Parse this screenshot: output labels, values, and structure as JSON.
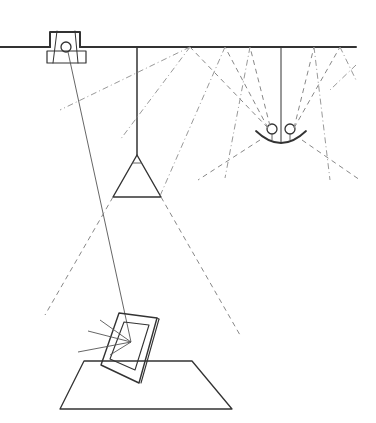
{
  "diagram": {
    "title": "",
    "type": "lighting-setup-illustration",
    "colors": {
      "line": "#333333",
      "dashed": "#888888",
      "background": "#ffffff"
    },
    "elements": {
      "ceiling": {
        "label": ""
      },
      "spotlight": {
        "label": ""
      },
      "pendant_lamp": {
        "label": ""
      },
      "uplight_fixture": {
        "label": ""
      },
      "picture_frame": {
        "label": ""
      },
      "table": {
        "label": ""
      }
    }
  }
}
